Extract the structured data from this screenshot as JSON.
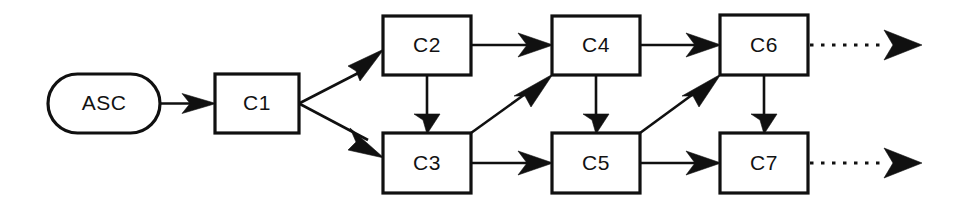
{
  "diagram": {
    "type": "flowchart",
    "background_color": "#ffffff",
    "line_color": "#101010",
    "node_fill_color": "#ffffff",
    "nodes": [
      {
        "id": "ASC",
        "label": "ASC",
        "shape": "stadium",
        "x": 48,
        "y": 74,
        "w": 112,
        "h": 59
      },
      {
        "id": "C1",
        "label": "C1",
        "shape": "rect",
        "x": 215,
        "y": 74,
        "w": 84,
        "h": 59
      },
      {
        "id": "C2",
        "label": "C2",
        "shape": "rect",
        "x": 383,
        "y": 16,
        "w": 88,
        "h": 59
      },
      {
        "id": "C3",
        "label": "C3",
        "shape": "rect",
        "x": 383,
        "y": 133,
        "w": 88,
        "h": 60
      },
      {
        "id": "C4",
        "label": "C4",
        "shape": "rect",
        "x": 552,
        "y": 16,
        "w": 88,
        "h": 59
      },
      {
        "id": "C5",
        "label": "C5",
        "shape": "rect",
        "x": 552,
        "y": 133,
        "w": 88,
        "h": 60
      },
      {
        "id": "C6",
        "label": "C6",
        "shape": "rect",
        "x": 720,
        "y": 15,
        "w": 88,
        "h": 60
      },
      {
        "id": "C7",
        "label": "C7",
        "shape": "rect",
        "x": 720,
        "y": 133,
        "w": 88,
        "h": 60
      }
    ],
    "edges": [
      {
        "id": "asc-c1",
        "from": "ASC",
        "to": "C1",
        "style": "solid",
        "direction": "right"
      },
      {
        "id": "c1-c2",
        "from": "C1",
        "to": "C2",
        "style": "solid",
        "direction": "up-right"
      },
      {
        "id": "c1-c3",
        "from": "C1",
        "to": "C3",
        "style": "solid",
        "direction": "down-right"
      },
      {
        "id": "c2-c4",
        "from": "C2",
        "to": "C4",
        "style": "solid",
        "direction": "right"
      },
      {
        "id": "c2-c3",
        "from": "C2",
        "to": "C3",
        "style": "solid",
        "direction": "down"
      },
      {
        "id": "c3-c4",
        "from": "C3",
        "to": "C4",
        "style": "solid",
        "direction": "up-right"
      },
      {
        "id": "c3-c5",
        "from": "C3",
        "to": "C5",
        "style": "solid",
        "direction": "right"
      },
      {
        "id": "c4-c6",
        "from": "C4",
        "to": "C6",
        "style": "solid",
        "direction": "right"
      },
      {
        "id": "c4-c5",
        "from": "C4",
        "to": "C5",
        "style": "solid",
        "direction": "down"
      },
      {
        "id": "c5-c6",
        "from": "C5",
        "to": "C6",
        "style": "solid",
        "direction": "up-right"
      },
      {
        "id": "c5-c7",
        "from": "C5",
        "to": "C7",
        "style": "solid",
        "direction": "right"
      },
      {
        "id": "c6-c7",
        "from": "C6",
        "to": "C7",
        "style": "solid",
        "direction": "down"
      },
      {
        "id": "c6-out",
        "from": "C6",
        "to": null,
        "style": "dashed",
        "direction": "right"
      },
      {
        "id": "c7-out",
        "from": "C7",
        "to": null,
        "style": "dashed",
        "direction": "right"
      }
    ]
  }
}
